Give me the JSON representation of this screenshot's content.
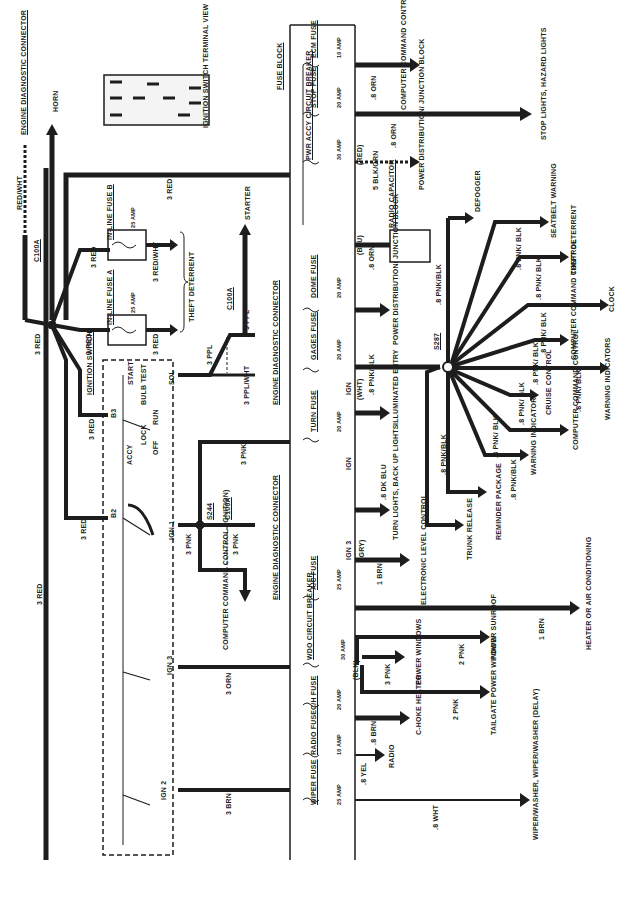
{
  "orientation": "rotated 90° counter-clockwise",
  "fuse_block": {
    "label": "FUSE BLOCK",
    "fuses": [
      {
        "name": "ECM FUSE",
        "rating": "10 AMP",
        "wire": ".8 ORN",
        "destination": "COMPUTER COMMAND CONTROL (CHECK ENGINE INDICATOR)"
      },
      {
        "name": "STOP FUSE",
        "rating": "20 AMP",
        "wire": ".8 ORN",
        "destination": "STOP LIGHTS, HAZARD LIGHTS"
      },
      {
        "name": "PWR ACCY CIRCUIT BREAKER",
        "rating": "30 AMP",
        "connector_color": "(RED)",
        "wire": "5 BLK/ORN",
        "destination": "POWER DISTRIBUTION/ JUNCTION BLOCK"
      },
      {
        "name": "DOME FUSE",
        "rating": "20 AMP",
        "connector_color": "(BLU)",
        "wire": ".8 ORN",
        "destination": "POWER DISTRIBUTION/ JUNCTION BLOCK"
      },
      {
        "name": "GAGES FUSE",
        "rating": "20 AMP",
        "feed": "IGN",
        "connector_color": "(WHT)",
        "wire": ".8 PNK/BLK",
        "destination": "ILLUMINATED ENTRY"
      },
      {
        "name": "TURN FUSE",
        "rating": "20 AMP",
        "feed": "IGN",
        "wire": ".8 DK BLU",
        "destination": "TURN LIGHTS, BACK UP LIGHTS"
      },
      {
        "name": "A/C FUSE",
        "rating": "25 AMP",
        "feed": "IGN 3",
        "connector_color": "(GRY)",
        "wire": "1 BRN",
        "destination": "ELECTRONIC LEVEL CONTROL"
      },
      {
        "name": "WDO CIRCUIT BREAKER",
        "rating": "30 AMP",
        "connector_color": "(BLK)",
        "wire": "3 PNK",
        "destination": "POWER WINDOWS"
      },
      {
        "name": "C/H FUSE",
        "rating": "20 AMP",
        "wire": ".8 BRN",
        "destination": "C-HOKE HEATER"
      },
      {
        "name": "RADIO FUSE",
        "rating": "10 AMP",
        "wire": ".8 YEL",
        "destination": "RADIO"
      },
      {
        "name": "WIPER FUSE",
        "rating": "25 AMP",
        "wire": ".8 WHT",
        "destination": "WIPER/WASHER, WIPER/WASHER (DELAY)"
      }
    ],
    "extra_outputs": [
      {
        "wire": "1 BRN",
        "destination": "HEATER OR AIR CONDITIONING"
      },
      {
        "wire": "2 PNK",
        "destination": "POWER SUNROOF"
      },
      {
        "wire": "2 PNK",
        "destination": "TAILGATE POWER WINDOW"
      }
    ]
  },
  "radio_capacitor": {
    "label": "RADIO CAPACITOR"
  },
  "splice_s287": {
    "label": "S287",
    "feed_wire": ".8 PNK/BLK",
    "branches": [
      {
        "wire": "",
        "destination": "DEFOGGER"
      },
      {
        "wire": ".8 PNK/ BLK",
        "destination": "SEATBELT WARNING"
      },
      {
        "wire": ".8 PNK/ BLK",
        "destination": "THEFT DETERRENT"
      },
      {
        "wire": "",
        "destination": "CLOCK"
      },
      {
        "wire": ".8 PNK/ BLK",
        "destination": "COMPUTER COMMAND CONTROL"
      },
      {
        "wire": ".8 PNK/ BLK",
        "destination": "WARNING INDICATORS"
      },
      {
        "wire": ".8 PNK/ BLK",
        "destination": "CRUISE CONTROL"
      },
      {
        "wire": ".8 PNK/ BLK",
        "destination": "COMPUTER COMMAND CONTROL"
      },
      {
        "wire": ".8 PNK/ BLK",
        "destination": "WARNING INDICATOR"
      },
      {
        "wire": ".8 PNK/BLK",
        "destination": "REMINDER PACKAGE"
      },
      {
        "wire": ".8 PNK/BLK",
        "destination": "TRUNK RELEASE"
      }
    ]
  },
  "ignition_switch": {
    "label": "IGNITION SWITCH",
    "terminal_view_label": "IGNITION SWITCH TERMINAL VIEW",
    "terminals": [
      "S",
      "B-1",
      "I-1",
      "B-2",
      "A",
      "B-3",
      "I-3",
      "G1",
      "G2"
    ],
    "positions": [
      "ACCY",
      "LOCK",
      "OFF",
      "RUN",
      "BULB TEST",
      "START"
    ],
    "outputs": [
      "B3",
      "B2",
      "SOL",
      "IGN 1",
      "IGN 3",
      "IGN 2"
    ]
  },
  "inline_fuses": [
    {
      "name": "IN-LINE FUSE A",
      "rating": "25 AMP",
      "in_wire": "3 RED",
      "out_wire": "3 RED"
    },
    {
      "name": "IN-LINE FUSE B",
      "rating": "25 AMP",
      "in_wire": "3 RED",
      "out_wire": "3 RED/WHT"
    }
  ],
  "theft_deterrent_label": "THEFT DETERRENT",
  "engine_diagnostic_connectors": [
    {
      "label": "ENGINE DIAGNOSTIC CONNECTOR",
      "pins": [
        "8",
        "9"
      ],
      "connector": "C100A",
      "wires": [
        "3 PPL",
        "3 PPL/WHT"
      ],
      "destination": "STARTER"
    },
    {
      "label": "ENGINE DIAGNOSTIC CONNECTOR",
      "pins": [
        "5",
        "4"
      ],
      "connector": "C100A",
      "splice": "S244",
      "wires": [
        "3 PNK",
        "3 PNK"
      ],
      "destination": "COMPUTER COMMAND CONTROL (IGNITION)"
    },
    {
      "label": "ENGINE DIAGNOSTIC CONNECTOR",
      "connector": "C100A",
      "wire": "RED/WHT"
    }
  ],
  "feeds": {
    "horn": "HORN",
    "main_red": "3 RED",
    "ign3_wire": "3 ORN",
    "ign2_wire": "3 BRN",
    "fuse_block_feed": "3 PNK"
  }
}
